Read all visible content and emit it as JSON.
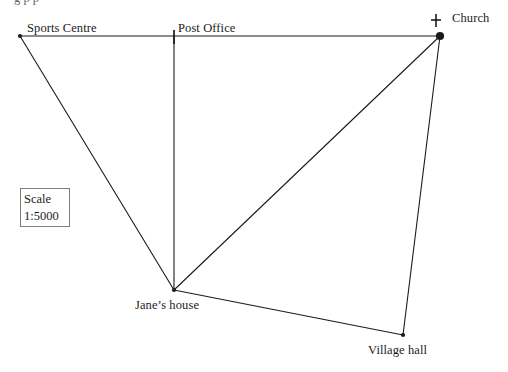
{
  "figure": {
    "kind": "scale-drawing-map",
    "clipped_caption_top": "g  p              p",
    "background_color": "#ffffff",
    "line_color": "#1b1b1b",
    "width": 508,
    "height": 372
  },
  "scale_box": {
    "name": "Scale",
    "title": "Scale",
    "ratio": "1:5000",
    "border_color": "#7d7d7d",
    "x": 20,
    "y": 188,
    "width": 50,
    "height": 39
  },
  "places": [
    {
      "id": "sports-centre",
      "label": "Sports Centre",
      "marker": "small-dot",
      "x": 20,
      "y": 36,
      "label_x": 27,
      "label_y": 22
    },
    {
      "id": "post-office",
      "label": "Post Office",
      "marker": "tick",
      "x": 174,
      "y": 36,
      "label_x": 178,
      "label_y": 22
    },
    {
      "id": "church",
      "label": "Church",
      "marker": "large-dot-with-cross",
      "x": 440,
      "y": 36,
      "label_x": 452,
      "label_y": 12
    },
    {
      "id": "janes-house",
      "label": "Jane’s house",
      "marker": "small-dot",
      "x": 174,
      "y": 290,
      "label_x": 135,
      "label_y": 299
    },
    {
      "id": "village-hall",
      "label": "Village hall",
      "marker": "small-dot",
      "x": 403,
      "y": 335,
      "label_x": 368,
      "label_y": 344
    }
  ],
  "connections": [
    {
      "id": "sports-centre-to-post-office",
      "from": "sports-centre",
      "to": "post-office"
    },
    {
      "id": "post-office-to-church",
      "from": "post-office",
      "to": "church"
    },
    {
      "id": "sports-centre-to-janes-house",
      "from": "sports-centre",
      "to": "janes-house"
    },
    {
      "id": "post-office-to-janes-house",
      "from": "post-office",
      "to": "janes-house"
    },
    {
      "id": "church-to-janes-house",
      "from": "church",
      "to": "janes-house"
    },
    {
      "id": "janes-house-to-village-hall",
      "from": "janes-house",
      "to": "village-hall"
    },
    {
      "id": "church-to-village-hall",
      "from": "church",
      "to": "village-hall"
    }
  ],
  "church_cross": {
    "center_x": 436,
    "center_y": 20,
    "arm": 5
  }
}
